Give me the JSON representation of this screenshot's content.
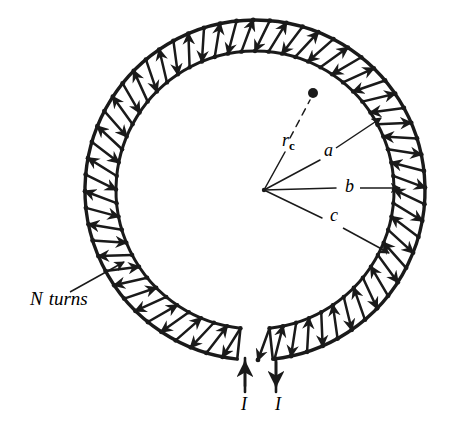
{
  "figure": {
    "type": "physics-diagram",
    "background_color": "#ffffff",
    "ink_color": "#1a1a1a",
    "width": 451,
    "height": 434
  },
  "labels": {
    "turns": {
      "symbol": "N",
      "text": "turns",
      "full": "N turns",
      "x": 30,
      "y": 305,
      "font_size": 19
    },
    "r_c": {
      "symbol": "r",
      "subscript": "c",
      "full": "rc",
      "x": 282,
      "y": 146,
      "font_size": 18
    },
    "a": {
      "symbol": "a",
      "x": 324,
      "y": 156,
      "font_size": 18
    },
    "b": {
      "symbol": "b",
      "x": 345,
      "y": 192,
      "font_size": 18
    },
    "c": {
      "symbol": "c",
      "x": 330,
      "y": 221,
      "font_size": 18
    },
    "current_in": {
      "symbol": "I",
      "x": 241,
      "y": 410,
      "font_size": 18,
      "direction": "up"
    },
    "current_out": {
      "symbol": "I",
      "x": 275,
      "y": 410,
      "font_size": 18,
      "direction": "down"
    }
  },
  "geometry": {
    "center_x": 255,
    "center_y": 190,
    "outer_radius": 170,
    "inner_radius": 139,
    "winding_count": 62,
    "gap_start_deg": 84,
    "gap_end_deg": 96,
    "winding_skew_deg": 5,
    "lead_left_x": 245,
    "lead_right_x": 276,
    "lead_bottom_y": 392,
    "rc_dot_x": 313,
    "rc_dot_y": 93,
    "rc_dot_radius": 5
  },
  "leaders": {
    "turns_arrow": {
      "x1": 70,
      "y1": 292,
      "x2": 124,
      "y2": 262
    },
    "a_arrow": {
      "x1": 336,
      "y1": 148,
      "x2": 381,
      "y2": 118
    },
    "b_arrow": {
      "x1": 360,
      "y1": 188,
      "x2": 400,
      "y2": 188
    },
    "c_arrow": {
      "x1": 343,
      "y1": 228,
      "x2": 389,
      "y2": 253
    },
    "rc_line": {
      "x1": 264,
      "y1": 190,
      "x2": 285,
      "y2": 152
    },
    "rc_dash": {
      "x1": 290,
      "y1": 138,
      "x2": 310,
      "y2": 100
    },
    "a_spoke": {
      "x1": 264,
      "y1": 190,
      "x2": 320,
      "y2": 160
    },
    "b_spoke": {
      "x1": 264,
      "y1": 190,
      "x2": 336,
      "y2": 188
    },
    "c_spoke": {
      "x1": 264,
      "y1": 190,
      "x2": 322,
      "y2": 218
    }
  }
}
